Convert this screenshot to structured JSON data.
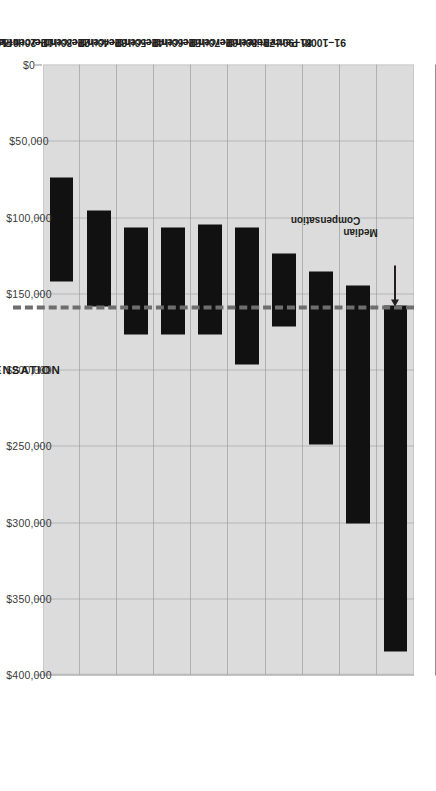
{
  "chart_data": {
    "type": "bar",
    "orientation": "floating-range-vertical-rotated",
    "title": "",
    "xlabel": "COLLECTIONS FROM PROFESSIONAL CHARGES",
    "ylabel": "RANGE OF COMPENSATION",
    "categories": [
      "91–100th Percentile",
      "81–90th Percentile",
      "71–80th Percentile",
      "61–70th Percentile",
      "51–60th Percentile",
      "41–50th Percentile",
      "31–40th Percentile",
      "21–30th Percentile",
      "11–20th Percentile",
      "0–10th Percentile"
    ],
    "ranges": [
      {
        "category": "91–100th Percentile",
        "low": 158000,
        "high": 385000
      },
      {
        "category": "81–90th Percentile",
        "low": 145000,
        "high": 301000
      },
      {
        "category": "71–80th Percentile",
        "low": 136000,
        "high": 249000
      },
      {
        "category": "61–70th Percentile",
        "low": 124000,
        "high": 172000
      },
      {
        "category": "51–60th Percentile",
        "low": 107000,
        "high": 197000
      },
      {
        "category": "41–50th Percentile",
        "low": 105000,
        "high": 177000
      },
      {
        "category": "31–40th Percentile",
        "low": 107000,
        "high": 177000
      },
      {
        "category": "21–30th Percentile",
        "low": 107000,
        "high": 177000
      },
      {
        "category": "11–20th Percentile",
        "low": 96000,
        "high": 159000
      },
      {
        "category": "0–10th Percentile",
        "low": 74000,
        "high": 142000
      }
    ],
    "ylim": [
      0,
      420000
    ],
    "value_ticks": [
      0,
      50000,
      100000,
      150000,
      200000,
      250000,
      300000,
      350000,
      400000
    ],
    "value_tick_labels": [
      "$0",
      "$50,000",
      "$100,000",
      "$150,000",
      "$200,000",
      "$250,000",
      "$300,000",
      "$350,000",
      "$400,000"
    ],
    "gridlines": true,
    "legend": "none",
    "annotations": [
      {
        "name": "median-compensation",
        "label": "Median\nCompensation",
        "value": 158000,
        "style": "dashed-line-with-arrow"
      }
    ],
    "colors": {
      "bar": "#111111",
      "plot_background": "#dcdcdc",
      "gridline": "#8e8e8e",
      "median_line": "#6e6e6e",
      "text": "#231f20",
      "page_background": "#ffffff"
    }
  },
  "axis_titles": {
    "category": "COLLECTIONS FROM PROFESSIONAL CHARGES",
    "value": "RANGE OF COMPENSATION"
  },
  "annotation": {
    "median_label_line1": "Median",
    "median_label_line2": "Compensation"
  }
}
